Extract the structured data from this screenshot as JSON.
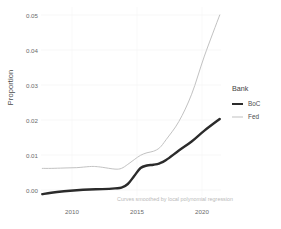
{
  "chart_data": {
    "type": "line",
    "title": "",
    "subtitle": "",
    "caption": "Curves smoothed by local polynomial regression",
    "xlabel": "",
    "ylabel": "Proportion",
    "xlim": [
      2008.2,
      2022.3
    ],
    "ylim": [
      0.0,
      0.052
    ],
    "grid": true,
    "legend": {
      "title": "Bank",
      "position": "right",
      "entries": [
        {
          "name": "BoC",
          "color": "#2b2b2b",
          "width": 2.4
        },
        {
          "name": "Fed",
          "color": "#c2c2c2",
          "width": 1.0
        }
      ]
    },
    "x_ticks": [
      {
        "value": 2010,
        "label": "2010",
        "px": 72
      },
      {
        "value": 2015,
        "label": "2015",
        "px": 137
      },
      {
        "value": 2020,
        "label": "2020",
        "px": 202
      }
    ],
    "y_ticks": [
      {
        "value": 0.05,
        "label": "0.05",
        "px": 15
      },
      {
        "value": 0.04,
        "label": "0.04",
        "px": 50
      },
      {
        "value": 0.03,
        "label": "0.03",
        "px": 85
      },
      {
        "value": 0.02,
        "label": "0.02",
        "px": 120
      },
      {
        "value": 0.01,
        "label": "0.01",
        "px": 155
      },
      {
        "value": 0.0,
        "label": "0.00",
        "px": 190
      }
    ],
    "series": [
      {
        "name": "BoC",
        "color": "#2b2b2b",
        "x": [
          2008.3,
          2009,
          2010,
          2011,
          2012,
          2013,
          2014,
          2014.5,
          2015,
          2015.5,
          2016,
          2016.5,
          2017,
          2017.5,
          2018,
          2019,
          2020,
          2021,
          2022.2
        ],
        "values": [
          0.0005,
          0.0009,
          0.0013,
          0.0016,
          0.0018,
          0.0019,
          0.0021,
          0.0023,
          0.0033,
          0.0055,
          0.0077,
          0.0084,
          0.0086,
          0.009,
          0.0099,
          0.0125,
          0.015,
          0.018,
          0.0212
        ]
      },
      {
        "name": "Fed",
        "color": "#c2c2c2",
        "x": [
          2008.3,
          2009,
          2010,
          2011,
          2012,
          2012.5,
          2013,
          2014,
          2014.5,
          2015,
          2015.5,
          2016,
          2016.5,
          2017,
          2017.5,
          2018,
          2019,
          2020,
          2021,
          2022.2
        ],
        "values": [
          0.0076,
          0.0076,
          0.0077,
          0.0078,
          0.0081,
          0.0081,
          0.0079,
          0.0074,
          0.0076,
          0.0087,
          0.01,
          0.0112,
          0.0119,
          0.0123,
          0.0133,
          0.0155,
          0.0205,
          0.028,
          0.0385,
          0.0498
        ]
      }
    ]
  }
}
